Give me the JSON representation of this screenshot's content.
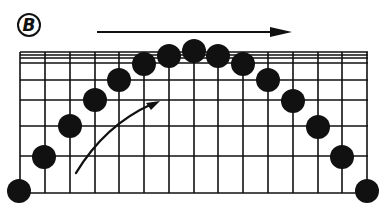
{
  "figure": {
    "panel_label": "B",
    "colors": {
      "ink": "#111111",
      "background": "#ffffff"
    }
  },
  "grid": {
    "x_lines": [
      20,
      45,
      70,
      95,
      119,
      144,
      169,
      194,
      218,
      243,
      268,
      293,
      318,
      342,
      367
    ],
    "y_lines": [
      52,
      55,
      58,
      63,
      80,
      100,
      126,
      156,
      193
    ],
    "left": 20,
    "right": 368,
    "top": 52,
    "bottom": 193
  },
  "balls": {
    "radius": 12,
    "points": [
      {
        "x": 19,
        "y": 191
      },
      {
        "x": 44,
        "y": 157
      },
      {
        "x": 70,
        "y": 126
      },
      {
        "x": 95,
        "y": 100
      },
      {
        "x": 119,
        "y": 80
      },
      {
        "x": 144,
        "y": 64
      },
      {
        "x": 169,
        "y": 56
      },
      {
        "x": 194,
        "y": 51
      },
      {
        "x": 218,
        "y": 56
      },
      {
        "x": 243,
        "y": 64
      },
      {
        "x": 268,
        "y": 80
      },
      {
        "x": 293,
        "y": 101
      },
      {
        "x": 318,
        "y": 127
      },
      {
        "x": 342,
        "y": 157
      },
      {
        "x": 367,
        "y": 191
      }
    ]
  },
  "arrows": {
    "horizontal": {
      "x1": 97,
      "y1": 32,
      "x2": 292,
      "y2": 32,
      "direction": "right"
    },
    "curved": {
      "start": [
        76,
        173
      ],
      "control": [
        105,
        125
      ],
      "end": [
        160,
        101
      ],
      "direction": "up-right"
    }
  }
}
